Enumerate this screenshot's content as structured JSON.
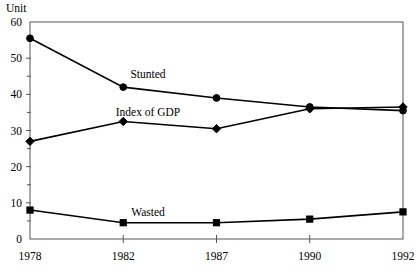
{
  "chart_data": {
    "type": "line",
    "title": "",
    "xlabel": "",
    "ylabel": "Unit",
    "ylim": [
      0,
      60
    ],
    "yticks": [
      0,
      10,
      20,
      30,
      40,
      50,
      60
    ],
    "ytick_labels": [
      "0",
      "10",
      "20",
      "30",
      "40",
      "50",
      "60"
    ],
    "minor_yticks": [
      5,
      15,
      25,
      35,
      45,
      55
    ],
    "grid": false,
    "legend_position": "inline-labels",
    "categories": [
      "1978",
      "1982",
      "1987",
      "1990",
      "1992"
    ],
    "x": [
      1978,
      1982,
      1987,
      1990,
      1992
    ],
    "series": [
      {
        "name": "Stunted",
        "marker": "circle",
        "values": [
          55.5,
          42.0,
          39.0,
          36.5,
          35.5
        ],
        "label_text": "Stunted"
      },
      {
        "name": "Index of GDP",
        "marker": "diamond",
        "values": [
          27.0,
          32.5,
          30.5,
          36.0,
          36.5
        ],
        "label_text": "Index of GDP"
      },
      {
        "name": "Wasted",
        "marker": "square",
        "values": [
          8.0,
          4.5,
          4.5,
          5.5,
          7.5
        ],
        "label_text": "Wasted"
      }
    ],
    "annotations": [
      {
        "text": "Stunted",
        "x_px": 148,
        "y_px": 78
      },
      {
        "text": "Index of GDP",
        "x_px": 148,
        "y_px": 116
      },
      {
        "text": "Wasted",
        "x_px": 148,
        "y_px": 216
      }
    ],
    "colors": {
      "line": "#000000",
      "marker": "#000000",
      "axis": "#555555",
      "background": "#ffffff",
      "text": "#000000"
    }
  },
  "axis": {
    "unit_label": "Unit"
  }
}
